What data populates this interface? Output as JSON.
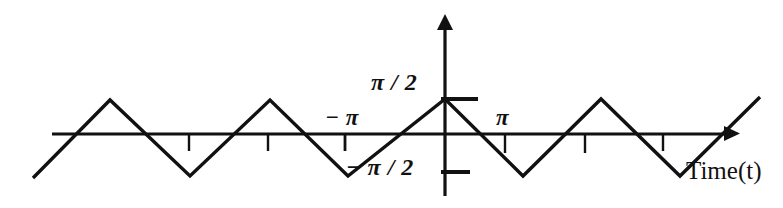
{
  "figure": {
    "title": "",
    "background_color": "#ffffff",
    "stroke_color": "#111111",
    "width": 783,
    "height": 208
  },
  "labels": {
    "y_positive": "π / 2",
    "y_negative": "− π / 2",
    "x_negative_pi": "− π",
    "x_positive_pi": "π",
    "x_axis_title": "Time(t)"
  },
  "chart_data": {
    "type": "line",
    "title": "",
    "xlabel": "Time(t)",
    "ylabel": "",
    "grid": false,
    "legend": null,
    "waveform": "triangle",
    "amplitude": 1.5708,
    "amplitude_label": "π / 2",
    "period_in_pi": 2,
    "y_tick_values": [
      1.5708,
      -1.5708
    ],
    "y_tick_labels": [
      "π / 2",
      "− π / 2"
    ],
    "x_tick_values": [
      -3.1416,
      3.1416
    ],
    "x_tick_labels": [
      "− π",
      "π"
    ],
    "x_minor_tick_px": [
      189,
      268,
      345,
      505,
      585,
      663
    ],
    "axis_origin_px": {
      "x": 445,
      "y": 134
    },
    "x_axis_span_px": [
      52,
      737
    ],
    "y_axis_span_px": [
      15,
      196
    ],
    "series": [
      {
        "name": "triangle wave",
        "points_px": [
          {
            "x": 33,
            "y": 178
          },
          {
            "x": 110,
            "y": 100
          },
          {
            "x": 190,
            "y": 176
          },
          {
            "x": 270,
            "y": 100
          },
          {
            "x": 348,
            "y": 176
          },
          {
            "x": 445,
            "y": 99
          },
          {
            "x": 523,
            "y": 176
          },
          {
            "x": 601,
            "y": 99
          },
          {
            "x": 680,
            "y": 176
          },
          {
            "x": 760,
            "y": 97
          }
        ],
        "points_math": [
          {
            "x": -6.28,
            "y": -1.5708
          },
          {
            "x": -4.71,
            "y": 1.5708
          },
          {
            "x": -3.14,
            "y": -1.5708
          },
          {
            "x": -1.57,
            "y": 1.5708
          },
          {
            "x": 0,
            "y": -1.5708
          },
          {
            "x": 1.57,
            "y": 1.5708
          },
          {
            "x": 3.14,
            "y": -1.5708
          },
          {
            "x": 4.71,
            "y": 1.5708
          },
          {
            "x": 6.28,
            "y": -1.5708
          },
          {
            "x": 7.85,
            "y": 1.5708
          }
        ]
      }
    ]
  }
}
